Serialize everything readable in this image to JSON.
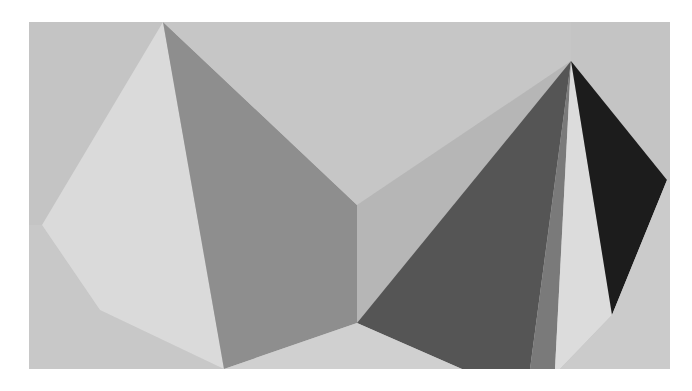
{
  "artwork": {
    "description": "Geometric abstract composition of two grayscale pyramids on a light gray ground",
    "canvas": {
      "width": 692,
      "height": 391,
      "background": "#ffffff"
    },
    "frame": {
      "x": 29,
      "y": 22,
      "width": 641,
      "height": 347,
      "fill": "#c4c4c4"
    },
    "colors": {
      "ground": "#c4c4c4",
      "lightest": "#dedede",
      "light": "#d2d2d2",
      "pale": "#cfcfcf",
      "mid_light": "#b4b4b4",
      "mid": "#8e8e8e",
      "mid_dark": "#838383",
      "dark": "#555555",
      "darker": "#6f6f6f",
      "black": "#1c1c1c"
    },
    "faces": [
      {
        "name": "left-pyramid-ground-lower-left",
        "fill": "#c8c8c8",
        "points": "29,225 42,225 100,310 224,369 29,369"
      },
      {
        "name": "left-pyramid-light-face",
        "fill": "#dadada",
        "points": "163,22 224,369 100,310 42,225"
      },
      {
        "name": "left-pyramid-dark-face",
        "fill": "#8e8e8e",
        "points": "163,22 357,205 357,323 224,369"
      },
      {
        "name": "middle-ground-top",
        "fill": "#c6c6c6",
        "points": "163,22 571,22 571,61 357,205"
      },
      {
        "name": "middle-pale-face",
        "fill": "#b6b6b6",
        "points": "357,205 571,61 357,323"
      },
      {
        "name": "right-pyramid-darkest-gray-face",
        "fill": "#555555",
        "points": "571,61 357,323 462,369 530,369"
      },
      {
        "name": "right-pyramid-mid-gray-face",
        "fill": "#7a7a7a",
        "points": "571,61 530,369 555,369"
      },
      {
        "name": "right-pyramid-white-face",
        "fill": "#dcdcdc",
        "points": "571,61 612,315 560,369 555,369"
      },
      {
        "name": "right-pyramid-black-face",
        "fill": "#1c1c1c",
        "points": "571,61 667,180 612,315"
      },
      {
        "name": "right-ground-lower-right",
        "fill": "#cbcbcb",
        "points": "667,180 670,180 670,369 560,369 612,315"
      },
      {
        "name": "bottom-ground-center",
        "fill": "#d0d0d0",
        "points": "224,369 357,323 462,369"
      }
    ]
  }
}
